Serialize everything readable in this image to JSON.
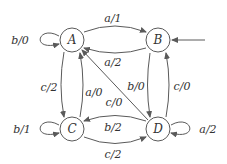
{
  "diagram": {
    "type": "state-machine",
    "states": [
      {
        "id": "A",
        "label": "A",
        "x": 72,
        "y": 40
      },
      {
        "id": "B",
        "label": "B",
        "x": 158,
        "y": 40
      },
      {
        "id": "C",
        "label": "C",
        "x": 72,
        "y": 129
      },
      {
        "id": "D",
        "label": "D",
        "x": 158,
        "y": 129
      }
    ],
    "initial_state": "B",
    "transitions": [
      {
        "from": "A",
        "to": "A",
        "label": "b/0"
      },
      {
        "from": "A",
        "to": "B",
        "label": "a/1"
      },
      {
        "from": "B",
        "to": "A",
        "label": "a/2"
      },
      {
        "from": "A",
        "to": "C",
        "label": "c/2"
      },
      {
        "from": "C",
        "to": "A",
        "label": "a/0"
      },
      {
        "from": "D",
        "to": "A",
        "label": "c/0"
      },
      {
        "from": "B",
        "to": "D",
        "label": "b/0"
      },
      {
        "from": "D",
        "to": "B",
        "label": "c/0"
      },
      {
        "from": "C",
        "to": "C",
        "label": "b/1"
      },
      {
        "from": "D",
        "to": "C",
        "label": "b/2"
      },
      {
        "from": "C",
        "to": "D",
        "label": "c/2"
      },
      {
        "from": "D",
        "to": "D",
        "label": "a/2"
      }
    ]
  }
}
